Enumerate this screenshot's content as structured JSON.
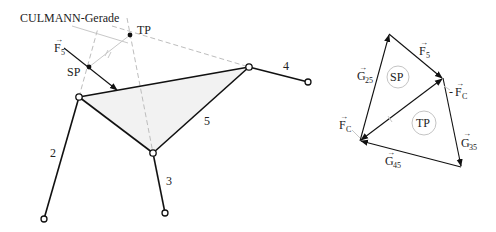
{
  "left_figure": {
    "culmann_label": "CULMANN-Gerade",
    "tp_label": "TP",
    "sp_label": "SP",
    "force_label": {
      "base": "F",
      "sub": "5",
      "arrow": "→"
    },
    "members": [
      {
        "id": "2",
        "label": "2"
      },
      {
        "id": "3",
        "label": "3"
      },
      {
        "id": "4",
        "label": "4"
      },
      {
        "id": "5",
        "label": "5"
      }
    ],
    "triangle_fill": "#f2f2f2"
  },
  "right_figure": {
    "sp_label": "SP",
    "tp_label": "TP",
    "vectors": {
      "f5": {
        "base": "F",
        "sub": "5",
        "arrow": "→"
      },
      "g25": {
        "base": "G",
        "sub": "25",
        "arrow": "→"
      },
      "g35": {
        "base": "G",
        "sub": "35",
        "arrow": "→"
      },
      "g45": {
        "base": "G",
        "sub": "45",
        "arrow": "→"
      },
      "fc": {
        "base": "F",
        "sub": "C",
        "arrow": "→"
      },
      "neg_fc": {
        "prefix": "-",
        "base": "F",
        "sub": "C",
        "arrow": "→"
      }
    }
  }
}
